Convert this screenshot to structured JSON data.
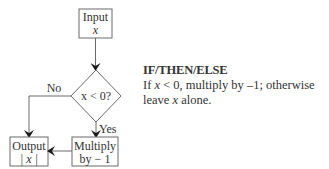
{
  "diagram": {
    "type": "flowchart",
    "nodes": {
      "input": {
        "line1": "Input",
        "line2": "x"
      },
      "decision": {
        "label": "x < 0?"
      },
      "multiply": {
        "line1": "Multiply",
        "line2": "by − 1"
      },
      "output": {
        "line1": "Output",
        "line2": "| x |"
      }
    },
    "edges": {
      "no_label": "No",
      "yes_label": "Yes"
    }
  },
  "side_text": {
    "title": "IF/THEN/ELSE",
    "body_part1": "If ",
    "body_var1": "x",
    "body_part2": " < 0, multiply by –1; otherwise leave ",
    "body_var2": "x",
    "body_part3": " alone."
  },
  "colors": {
    "stroke": "#6a6a6a",
    "text": "#333333",
    "arrowhead": "#1a1a1a"
  }
}
